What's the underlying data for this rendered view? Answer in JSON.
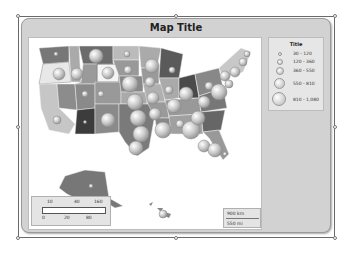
{
  "map": {
    "title": "Map Title",
    "legend": {
      "title": "Title",
      "items": [
        {
          "label": "30 - 120",
          "size": 3
        },
        {
          "label": "120 - 360",
          "size": 5
        },
        {
          "label": "360 - 550",
          "size": 7
        },
        {
          "label": "550 - 810",
          "size": 9
        },
        {
          "label": "810 - 1,080",
          "size": 12
        }
      ]
    },
    "color_scale": {
      "top_ticks": [
        "10",
        "40",
        "160"
      ],
      "bottom_ticks": [
        "0",
        "20",
        "80"
      ]
    },
    "distance_scale": {
      "km": "900 km",
      "mi": "550 mi"
    }
  }
}
